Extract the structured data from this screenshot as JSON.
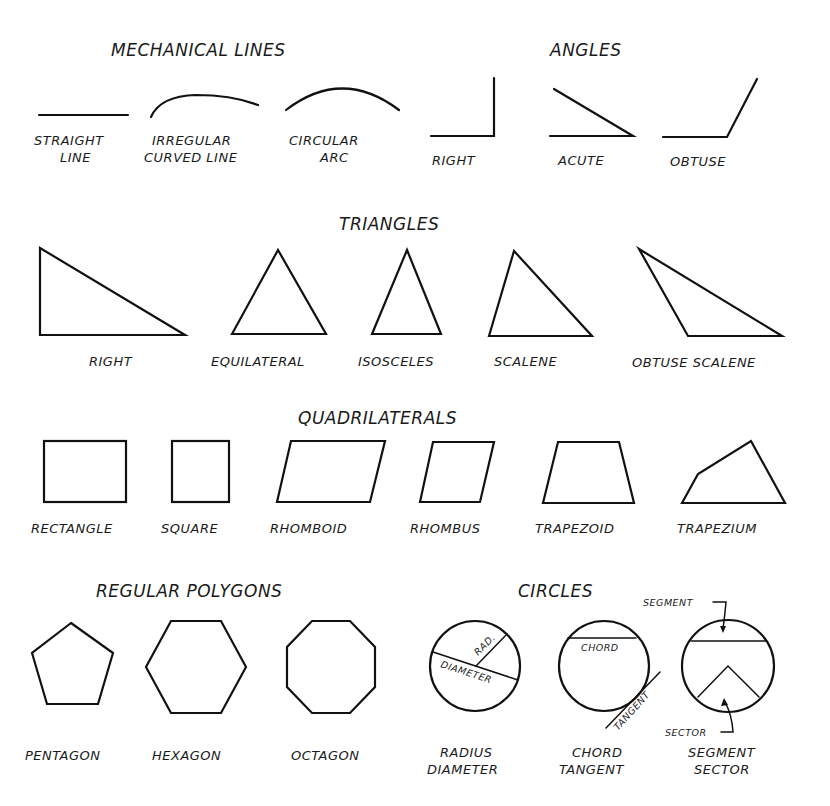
{
  "sections": {
    "mechanical_lines": {
      "title": "MECHANICAL LINES",
      "items": [
        {
          "label_1": "STRAIGHT",
          "label_2": "LINE"
        },
        {
          "label_1": "IRREGULAR",
          "label_2": "CURVED LINE"
        },
        {
          "label_1": "CIRCULAR",
          "label_2": "ARC"
        }
      ]
    },
    "angles": {
      "title": "ANGLES",
      "items": [
        {
          "label": "RIGHT"
        },
        {
          "label": "ACUTE"
        },
        {
          "label": "OBTUSE"
        }
      ]
    },
    "triangles": {
      "title": "TRIANGLES",
      "items": [
        {
          "label": "RIGHT"
        },
        {
          "label": "EQUILATERAL"
        },
        {
          "label": "ISOSCELES"
        },
        {
          "label": "SCALENE"
        },
        {
          "label": "OBTUSE SCALENE"
        }
      ]
    },
    "quadrilaterals": {
      "title": "QUADRILATERALS",
      "items": [
        {
          "label": "RECTANGLE"
        },
        {
          "label": "SQUARE"
        },
        {
          "label": "RHOMBOID"
        },
        {
          "label": "RHOMBUS"
        },
        {
          "label": "TRAPEZOID"
        },
        {
          "label": "TRAPEZIUM"
        }
      ]
    },
    "regular_polygons": {
      "title": "REGULAR POLYGONS",
      "items": [
        {
          "label": "PENTAGON"
        },
        {
          "label": "HEXAGON"
        },
        {
          "label": "OCTAGON"
        }
      ]
    },
    "circles": {
      "title": "CIRCLES",
      "items": [
        {
          "label_1": "RADIUS",
          "label_2": "DIAMETER",
          "annotations": {
            "radius": "RAD.",
            "diameter": "DIAMETER"
          }
        },
        {
          "label_1": "CHORD",
          "label_2": "TANGENT",
          "annotations": {
            "chord": "CHORD",
            "tangent": "TANGENT"
          }
        },
        {
          "label_1": "SEGMENT",
          "label_2": "SECTOR",
          "annotations": {
            "segment": "SEGMENT",
            "sector": "SECTOR"
          }
        }
      ]
    }
  }
}
